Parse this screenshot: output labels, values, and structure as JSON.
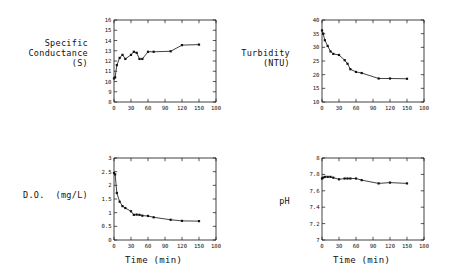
{
  "figure": {
    "background": "#ffffff",
    "ink": "#111111",
    "layout": "2x2 subplot grid"
  },
  "chart_data": [
    {
      "id": "specific-conductance",
      "type": "line",
      "title": "",
      "ylabel": "Specific\nConductance\n(S)",
      "ylabel_lines": [
        "Specific",
        "Conductance",
        "(S)"
      ],
      "xlabel": "",
      "xlim": [
        0,
        180
      ],
      "ylim": [
        8,
        16
      ],
      "xticks": [
        0,
        30,
        60,
        90,
        120,
        150,
        180
      ],
      "xticklabels": [
        "0",
        "30",
        "60",
        "90",
        "120",
        "150",
        "180"
      ],
      "yticks": [
        8,
        9,
        10,
        11,
        12,
        13,
        14,
        15,
        16
      ],
      "yticklabels": [
        "8",
        "9",
        "10",
        "11",
        "12",
        "13",
        "14",
        "15",
        "16"
      ],
      "grid": false,
      "legend": "none",
      "marker": "square",
      "x": [
        0,
        2,
        5,
        10,
        15,
        20,
        30,
        35,
        40,
        45,
        50,
        60,
        70,
        100,
        120,
        150
      ],
      "values": [
        10.3,
        10.4,
        11.6,
        12.3,
        12.6,
        12.2,
        12.6,
        12.9,
        12.8,
        12.2,
        12.2,
        12.9,
        12.9,
        12.95,
        13.55,
        13.6
      ]
    },
    {
      "id": "turbidity",
      "type": "line",
      "title": "",
      "ylabel": "Turbidity\n(NTU)",
      "ylabel_lines": [
        "Turbidity",
        "(NTU)"
      ],
      "xlabel": "",
      "xlim": [
        0,
        180
      ],
      "ylim": [
        10,
        40
      ],
      "xticks": [
        0,
        30,
        60,
        90,
        120,
        150,
        180
      ],
      "xticklabels": [
        "0",
        "30",
        "60",
        "90",
        "120",
        "150",
        "180"
      ],
      "yticks": [
        10,
        15,
        20,
        25,
        30,
        35,
        40
      ],
      "yticklabels": [
        "10",
        "15",
        "20",
        "25",
        "30",
        "35",
        "40"
      ],
      "grid": false,
      "legend": "none",
      "marker": "square",
      "x": [
        0,
        2,
        5,
        10,
        15,
        20,
        30,
        40,
        45,
        50,
        60,
        70,
        100,
        120,
        150
      ],
      "values": [
        36.2,
        35.0,
        32.6,
        30.5,
        28.5,
        27.6,
        27.2,
        25.3,
        24.0,
        22.0,
        21.0,
        20.6,
        18.6,
        18.6,
        18.5
      ]
    },
    {
      "id": "dissolved-oxygen",
      "type": "line",
      "title": "",
      "ylabel": "D.O. (mg/L)",
      "ylabel_lines": [
        "D.O.  (mg/L)"
      ],
      "xlabel": "Time (min)",
      "xlim": [
        0,
        180
      ],
      "ylim": [
        0,
        3
      ],
      "xticks": [
        0,
        30,
        60,
        90,
        120,
        150,
        180
      ],
      "xticklabels": [
        "0",
        "30",
        "60",
        "90",
        "120",
        "150",
        "180"
      ],
      "yticks": [
        0,
        0.5,
        1,
        1.5,
        2,
        2.5,
        3
      ],
      "yticklabels": [
        "0",
        "0.5",
        "1",
        "1.5",
        "2",
        "2.5",
        "3"
      ],
      "grid": false,
      "legend": "none",
      "marker": "square",
      "x": [
        0,
        2,
        5,
        10,
        15,
        20,
        30,
        35,
        40,
        45,
        50,
        60,
        70,
        100,
        120,
        150
      ],
      "values": [
        2.45,
        2.4,
        1.72,
        1.4,
        1.24,
        1.17,
        1.05,
        0.92,
        0.93,
        0.92,
        0.89,
        0.88,
        0.83,
        0.74,
        0.7,
        0.69
      ]
    },
    {
      "id": "ph",
      "type": "line",
      "title": "",
      "ylabel": "pH",
      "ylabel_lines": [
        "pH"
      ],
      "xlabel": "Time (min)",
      "xlim": [
        0,
        180
      ],
      "ylim": [
        7,
        8
      ],
      "xticks": [
        0,
        30,
        60,
        90,
        120,
        150,
        180
      ],
      "xticklabels": [
        "0",
        "30",
        "60",
        "90",
        "120",
        "150",
        "180"
      ],
      "yticks": [
        7,
        7.2,
        7.4,
        7.6,
        7.8,
        8
      ],
      "yticklabels": [
        "7",
        "7.2",
        "7.4",
        "7.6",
        "7.8",
        "8"
      ],
      "grid": false,
      "legend": "none",
      "marker": "square",
      "x": [
        0,
        2,
        5,
        10,
        15,
        20,
        30,
        40,
        45,
        50,
        60,
        70,
        100,
        120,
        150
      ],
      "values": [
        7.75,
        7.76,
        7.77,
        7.77,
        7.77,
        7.76,
        7.74,
        7.75,
        7.75,
        7.75,
        7.75,
        7.73,
        7.69,
        7.7,
        7.69
      ]
    }
  ]
}
